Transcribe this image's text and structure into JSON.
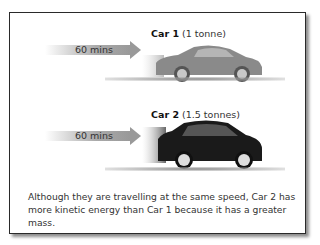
{
  "car1": {
    "name": "Car 1",
    "mass": "(1 tonne)",
    "speed_label": "60 mins",
    "color": "#8c8c8c"
  },
  "car2": {
    "name": "Car 2",
    "mass": "(1.5 tonnes)",
    "speed_label": "60 mins",
    "color": "#1a1a1a"
  },
  "caption": "Although they are travelling at the same speed, Car 2 has more kinetic energy than Car 1 because it has a greater mass."
}
